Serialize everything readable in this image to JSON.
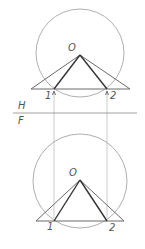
{
  "diagram": {
    "fold_line": {
      "upper_label": "H",
      "lower_label": "F"
    },
    "top_view": {
      "apex_label": "O",
      "point_labels": [
        "1",
        "2"
      ]
    },
    "front_view": {
      "apex_label": "O",
      "point_labels": [
        "1",
        "2"
      ]
    },
    "caption": ""
  }
}
